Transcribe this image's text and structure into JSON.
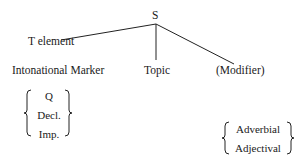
{
  "tree": {
    "root": "S",
    "children": [
      {
        "label": "T element",
        "sublabel": "Intonational Marker",
        "options": [
          "Q",
          "Decl.",
          "Imp."
        ]
      },
      {
        "label": "Topic"
      },
      {
        "label": "(Modifier)",
        "options": [
          "Adverbial",
          "Adjectival"
        ]
      }
    ]
  }
}
